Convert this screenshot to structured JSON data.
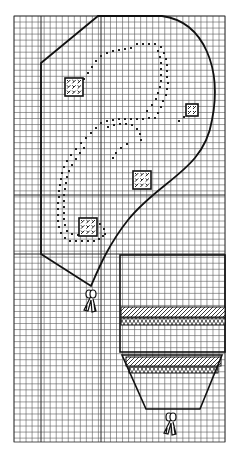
{
  "title": "",
  "colors": {
    "background": "#ffffff",
    "grid": "#5a5a5a",
    "grid_major": "#2a2a2a",
    "outline": "#111111",
    "stitch": "#222222"
  },
  "grid": {
    "x0": 14,
    "y0": 16,
    "x1": 225,
    "y1": 442,
    "cell": 6.03,
    "major_vertical": [
      41,
      101
    ],
    "major_horizontal": [
      195,
      254
    ]
  },
  "case_outline": "M41,63 L98,16 L162,16 C205,22 222,70 212,120 C204,170 160,180 128,220 C108,245 98,270 91,286 L41,254 Z",
  "dotted_paths": [
    [
      [
        137,
        44
      ],
      [
        143,
        44
      ],
      [
        149,
        44
      ],
      [
        155,
        44
      ],
      [
        161,
        47
      ],
      [
        164,
        53
      ],
      [
        166,
        59
      ],
      [
        167,
        65
      ],
      [
        167,
        71
      ],
      [
        167,
        77
      ],
      [
        168,
        83
      ],
      [
        167,
        89
      ],
      [
        166,
        95
      ],
      [
        163,
        101
      ],
      [
        161,
        107
      ],
      [
        158,
        113
      ],
      [
        155,
        118
      ],
      [
        149,
        118
      ],
      [
        143,
        119
      ],
      [
        137,
        119
      ],
      [
        131,
        119
      ],
      [
        125,
        119
      ],
      [
        119,
        119
      ],
      [
        113,
        120
      ],
      [
        107,
        121
      ],
      [
        101,
        123
      ],
      [
        96,
        128
      ],
      [
        91,
        133
      ],
      [
        86,
        138
      ],
      [
        81,
        143
      ],
      [
        76,
        149
      ],
      [
        71,
        155
      ],
      [
        67,
        161
      ],
      [
        64,
        167
      ],
      [
        62,
        173
      ],
      [
        61,
        179
      ],
      [
        60,
        185
      ],
      [
        59,
        191
      ],
      [
        59,
        197
      ],
      [
        58,
        203
      ],
      [
        58,
        209
      ],
      [
        58,
        215
      ],
      [
        58,
        221
      ],
      [
        59,
        227
      ],
      [
        61,
        233
      ],
      [
        65,
        238
      ],
      [
        70,
        241
      ],
      [
        76,
        241
      ],
      [
        82,
        241
      ],
      [
        88,
        241
      ],
      [
        94,
        241
      ],
      [
        99,
        239
      ],
      [
        103,
        236
      ]
    ],
    [
      [
        131,
        48
      ],
      [
        125,
        49
      ],
      [
        119,
        50
      ],
      [
        113,
        51
      ],
      [
        107,
        53
      ],
      [
        101,
        56
      ],
      [
        96,
        61
      ],
      [
        92,
        67
      ],
      [
        88,
        73
      ],
      [
        84,
        79
      ],
      [
        80,
        84
      ]
    ],
    [
      [
        158,
        51
      ],
      [
        160,
        57
      ],
      [
        161,
        63
      ],
      [
        161,
        69
      ],
      [
        161,
        75
      ],
      [
        161,
        81
      ],
      [
        160,
        87
      ],
      [
        158,
        93
      ],
      [
        156,
        99
      ],
      [
        152,
        105
      ],
      [
        147,
        111
      ]
    ],
    [
      [
        108,
        127
      ],
      [
        114,
        125
      ],
      [
        120,
        124
      ],
      [
        126,
        124
      ],
      [
        132,
        125
      ],
      [
        137,
        129
      ],
      [
        140,
        134
      ],
      [
        141,
        140
      ]
    ],
    [
      [
        127,
        144
      ],
      [
        121,
        148
      ],
      [
        116,
        153
      ],
      [
        113,
        158
      ]
    ],
    [
      [
        84,
        148
      ],
      [
        80,
        153
      ],
      [
        76,
        159
      ],
      [
        72,
        165
      ],
      [
        69,
        171
      ],
      [
        67,
        177
      ],
      [
        66,
        183
      ],
      [
        65,
        189
      ],
      [
        64,
        195
      ],
      [
        64,
        201
      ],
      [
        64,
        207
      ],
      [
        64,
        213
      ],
      [
        64,
        219
      ],
      [
        65,
        225
      ],
      [
        67,
        231
      ],
      [
        72,
        234
      ],
      [
        78,
        235
      ],
      [
        84,
        235
      ],
      [
        90,
        235
      ],
      [
        96,
        234
      ]
    ],
    [
      [
        100,
        224
      ],
      [
        104,
        229
      ],
      [
        105,
        234
      ]
    ],
    [
      [
        179,
        121
      ],
      [
        184,
        117
      ],
      [
        189,
        114
      ]
    ]
  ],
  "motif_squares": [
    {
      "x": 65,
      "y": 78,
      "size": 18
    },
    {
      "x": 186,
      "y": 104,
      "size": 12
    },
    {
      "x": 133,
      "y": 171,
      "size": 18
    },
    {
      "x": 79,
      "y": 218,
      "size": 18
    }
  ],
  "tassel_left": {
    "x": 91,
    "y": 290
  },
  "shade": {
    "rect": {
      "x": 120,
      "y": 255,
      "w": 105,
      "h": 97
    },
    "trapezoid": "M122,355 L222,355 L200,409 L146,409 Z",
    "bands": [
      {
        "type": "hatch",
        "x": 121,
        "y": 307,
        "w": 104,
        "h": 10
      },
      {
        "type": "cross",
        "x": 121,
        "y": 318,
        "w": 104,
        "h": 7
      },
      {
        "type": "hatch",
        "x": 126,
        "y": 357,
        "w": 95,
        "h": 9
      },
      {
        "type": "cross",
        "x": 129,
        "y": 367,
        "w": 89,
        "h": 6
      }
    ]
  },
  "tassel_bottom": {
    "x": 171,
    "y": 413
  }
}
